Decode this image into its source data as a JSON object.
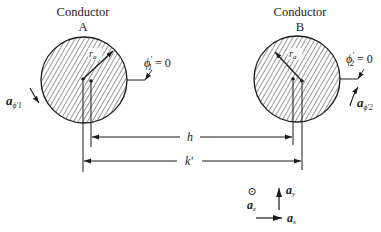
{
  "figure": {
    "type": "two-conductor cross-section diagram",
    "colors": {
      "ink": "#1a1a1a",
      "background": "#ffffff"
    }
  },
  "conductor_a": {
    "title": "Conductor",
    "letter": "A",
    "radius_label": "r",
    "radius_sub": "a",
    "phi_label": "ϕ",
    "phi_prime": "′",
    "phi_sub": "1",
    "phi_eq": " = 0",
    "unit_vector_label": "a",
    "unit_vector_sub": "ϕ′1"
  },
  "conductor_b": {
    "title": "Conductor",
    "letter": "B",
    "radius_label": "r",
    "radius_sub": "a",
    "phi_label": "ϕ",
    "phi_prime": "′",
    "phi_sub": "2",
    "phi_eq": " = 0",
    "unit_vector_label": "a",
    "unit_vector_sub": "ϕ′2"
  },
  "dimensions": {
    "inner_label": "h",
    "outer_label": "k′"
  },
  "axes": {
    "z_symbol": "⊙",
    "z_label": "a",
    "z_sub": "z",
    "y_label": "a",
    "y_sub": "y",
    "x_label": "a",
    "x_sub": "x"
  }
}
